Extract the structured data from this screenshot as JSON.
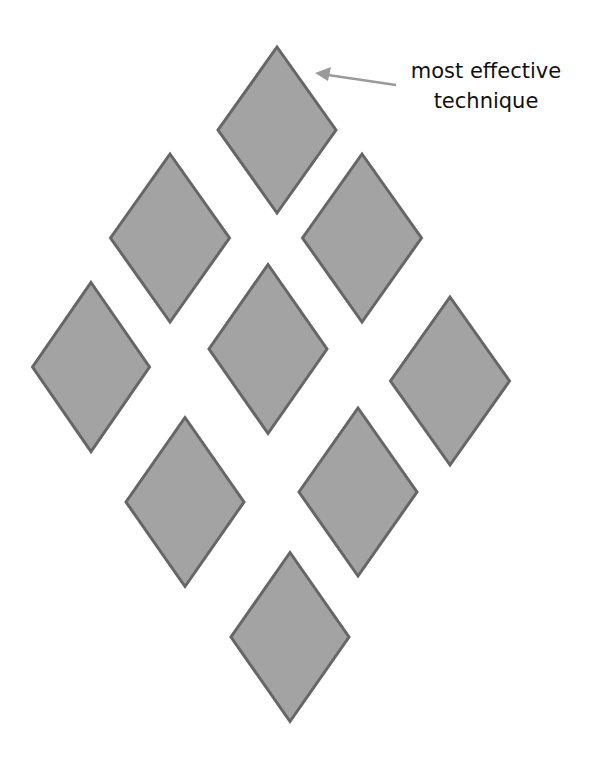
{
  "diagram": {
    "title": "",
    "annotation": {
      "line1": "most effective",
      "line2": "technique",
      "target": "top diamond"
    },
    "colors": {
      "diamond_fill": "#a3a3a3",
      "diamond_stroke": "#666666",
      "arrow": "#9a9a9a",
      "text": "#111111",
      "background": "#ffffff"
    },
    "diamonds": [
      {
        "id": "top",
        "cx": 277,
        "cy": 130,
        "w": 118,
        "h": 166
      },
      {
        "id": "upper-left",
        "cx": 170,
        "cy": 238,
        "w": 119,
        "h": 168
      },
      {
        "id": "upper-right",
        "cx": 362,
        "cy": 238,
        "w": 119,
        "h": 168
      },
      {
        "id": "left",
        "cx": 91,
        "cy": 367,
        "w": 117,
        "h": 169
      },
      {
        "id": "center",
        "cx": 268,
        "cy": 349,
        "w": 118,
        "h": 169
      },
      {
        "id": "right",
        "cx": 450,
        "cy": 381,
        "w": 119,
        "h": 168
      },
      {
        "id": "lower-left",
        "cx": 185,
        "cy": 502,
        "w": 118,
        "h": 169
      },
      {
        "id": "lower-right",
        "cx": 358,
        "cy": 492,
        "w": 118,
        "h": 168
      },
      {
        "id": "bottom",
        "cx": 290,
        "cy": 637,
        "w": 118,
        "h": 169
      }
    ]
  }
}
